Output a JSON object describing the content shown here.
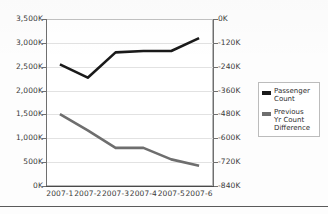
{
  "chart_data": {
    "type": "line",
    "title": "",
    "xlabel": "",
    "ylabel": "",
    "grid": true,
    "legend_position": "right",
    "categories": [
      "2007-1",
      "2007-2",
      "2007-3",
      "2007-4",
      "2007-5",
      "2007-6"
    ],
    "axes": {
      "left": {
        "label": "",
        "ticks": [
          "0K",
          "500K",
          "1,000K",
          "1,500K",
          "2,000K",
          "2,500K",
          "3,000K",
          "3,500K"
        ],
        "tick_values": [
          0,
          500000,
          1000000,
          1500000,
          2000000,
          2500000,
          3000000,
          3500000
        ],
        "ylim": [
          0,
          3500000
        ]
      },
      "right": {
        "label": "",
        "ticks": [
          "0K",
          "-120K",
          "-240K",
          "-360K",
          "-480K",
          "-600K",
          "-720K",
          "-840K"
        ],
        "tick_values": [
          0,
          -120000,
          -240000,
          -360000,
          -480000,
          -600000,
          -720000,
          -840000
        ],
        "ylim": [
          -840000,
          0
        ]
      }
    },
    "series": [
      {
        "name": "Passenger Count",
        "axis": "left",
        "color": "#1a1a1a",
        "values": [
          2550000,
          2270000,
          2800000,
          2830000,
          2830000,
          3100000
        ]
      },
      {
        "name": "Previous Yr Count Difference",
        "axis": "right",
        "color": "#6e6e6e",
        "values": [
          -478000,
          -560000,
          -648000,
          -648000,
          -706000,
          -738000
        ]
      }
    ]
  },
  "legend": {
    "items": [
      {
        "label": "Passenger\nCount",
        "color": "#1a1a1a",
        "swatch_name": "legend-swatch-passenger-count"
      },
      {
        "label": "Previous\nYr Count\nDifference",
        "color": "#6e6e6e",
        "swatch_name": "legend-swatch-prev-yr-difference"
      }
    ]
  }
}
